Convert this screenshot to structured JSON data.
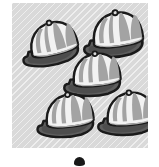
{
  "illustration": {
    "title": "Five baseball caps",
    "panel": {
      "background_color": "#d9d9d9",
      "hatch_color": "#ffffff",
      "x": 12,
      "y": 3,
      "width": 136,
      "height": 145
    },
    "marker": {
      "name": "bullet-dot",
      "color": "#181818",
      "x": 74,
      "y": 157,
      "width": 11,
      "height": 9
    },
    "palette": {
      "outline": "#1a1a1a",
      "crown_light": "#f2f2f2",
      "crown_stripe": "#9e9e9e",
      "crown_shade": "#c4c4c4",
      "brim_dark": "#5e5e5e",
      "brim_shade": "#3f3f3f"
    },
    "count": 5,
    "caps": [
      {
        "id": "cap-top-left",
        "label": "Cap 1",
        "cx": 40,
        "cy": 40,
        "scale": 1.0,
        "rotate": -14
      },
      {
        "id": "cap-top-right",
        "label": "Cap 2",
        "cx": 104,
        "cy": 31,
        "scale": 1.05,
        "rotate": -8
      },
      {
        "id": "cap-center",
        "label": "Cap 3",
        "cx": 83,
        "cy": 71,
        "scale": 1.0,
        "rotate": -6
      },
      {
        "id": "cap-bottom-left",
        "label": "Cap 4",
        "cx": 56,
        "cy": 112,
        "scale": 1.0,
        "rotate": -7
      },
      {
        "id": "cap-bottom-right",
        "label": "Cap 5",
        "cx": 117,
        "cy": 110,
        "scale": 1.0,
        "rotate": -6
      }
    ]
  }
}
